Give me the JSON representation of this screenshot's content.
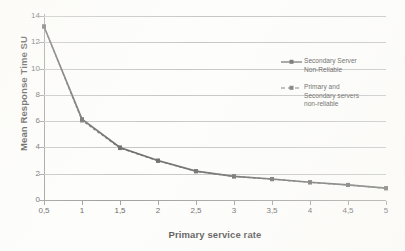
{
  "chart_data": {
    "type": "line",
    "title": "",
    "xlabel": "Primary service rate",
    "ylabel": "Mean Response Time SU",
    "x": [
      0.5,
      1,
      1.5,
      2,
      2.5,
      3,
      3.5,
      4,
      4.5,
      5
    ],
    "x_tick_labels": [
      "0,5",
      "1",
      "1,5",
      "2",
      "2,5",
      "3",
      "3,5",
      "4",
      "4,5",
      "5"
    ],
    "y_tick_labels": [
      "0",
      "2",
      "4",
      "6",
      "8",
      "10",
      "12",
      "14"
    ],
    "y_ticks": [
      0,
      2,
      4,
      6,
      8,
      10,
      12,
      14
    ],
    "xlim": [
      0.5,
      5
    ],
    "ylim": [
      0,
      14
    ],
    "grid": "horizontal",
    "legend_position": "inside-right",
    "series": [
      {
        "name": "Secondary Server Non-Reliable",
        "legend_label_line1": "Secondary Server",
        "legend_label_line2": "Non-Reliable",
        "style": "solid",
        "marker": "square",
        "color": "#4a4a4a",
        "values": [
          13.2,
          6.15,
          4.0,
          3.0,
          2.2,
          1.8,
          1.6,
          1.35,
          1.15,
          0.9
        ]
      },
      {
        "name": "Primary and Secondary servers non-reliable",
        "legend_label_line1": "Primary and",
        "legend_label_line2": "Secondary servers",
        "legend_label_line3": "non-reliable",
        "style": "dashed",
        "marker": "square",
        "color": "#555555",
        "values": [
          13.2,
          6.05,
          3.95,
          2.98,
          2.18,
          1.79,
          1.58,
          1.34,
          1.14,
          0.89
        ]
      }
    ],
    "colors": {
      "grid": "#b9b9b9",
      "axis": "#8a8a8a",
      "text": "#2b2b2b",
      "series1": "#4a4a4a",
      "series2": "#555555",
      "background": "#fdfdfb"
    }
  }
}
